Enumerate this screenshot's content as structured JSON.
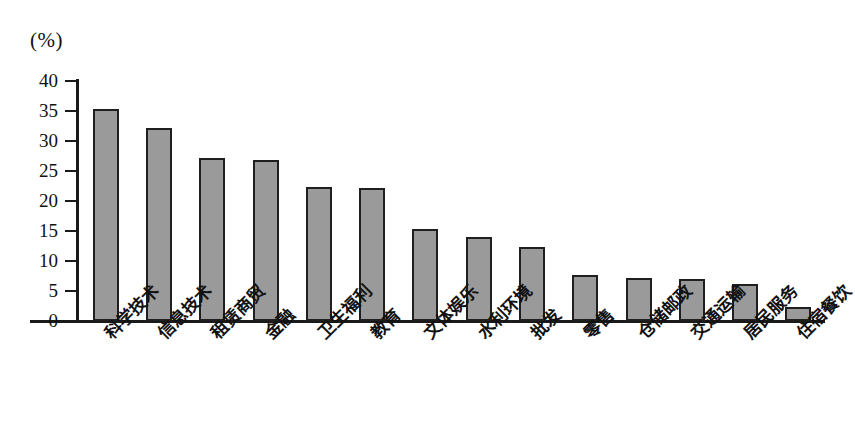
{
  "chart_data": {
    "type": "bar",
    "title": "",
    "subtitle": "",
    "xlabel": "",
    "ylabel": "",
    "unit_label": "(%)",
    "ylim": [
      0,
      40
    ],
    "ytick_step": 5,
    "yticks": [
      "40",
      "35",
      "30",
      "25",
      "20",
      "15",
      "10",
      "5",
      "0"
    ],
    "grid": false,
    "legend": null,
    "bar_color": "#9a9a9a",
    "bar_border_color": "#1f1f1f",
    "axis_color": "#1a1a1a",
    "background": "#ffffff",
    "categories": [
      "科学技术",
      "信息技术",
      "租赁商贸",
      "金融",
      "卫生福利",
      "教育",
      "文体娱乐",
      "水利环境",
      "批发",
      "零售",
      "仓储邮政",
      "交通运输",
      "居民服务",
      "住宿餐饮"
    ],
    "values": [
      35.4,
      32.1,
      27.1,
      26.8,
      22.3,
      22.1,
      15.3,
      14.0,
      12.3,
      7.6,
      7.2,
      7.0,
      6.1,
      2.3
    ]
  }
}
